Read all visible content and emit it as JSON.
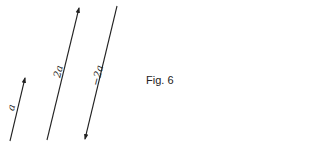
{
  "figure": {
    "caption": "Fig. 6",
    "vectors": [
      {
        "label": "a",
        "direction": "up"
      },
      {
        "label": "2a",
        "direction": "up"
      },
      {
        "label": "−2a",
        "direction": "down"
      }
    ]
  },
  "colors": {
    "line": "#222222",
    "background": "#ffffff"
  }
}
